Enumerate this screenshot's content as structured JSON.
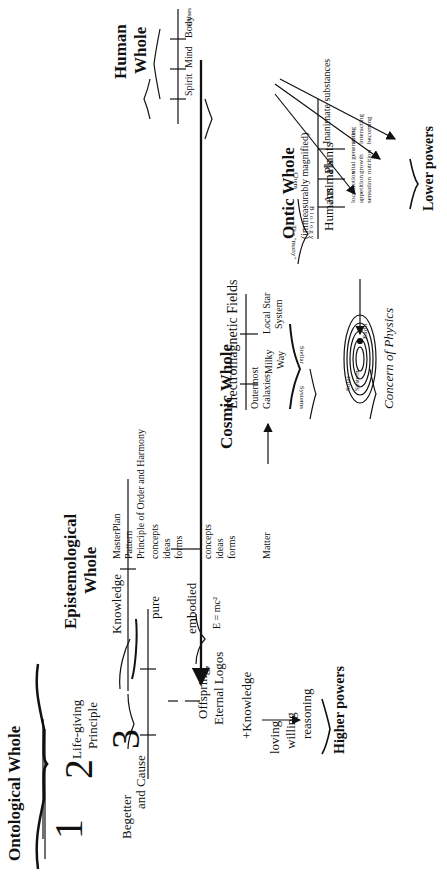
{
  "ontological": {
    "title": "Ontological Whole",
    "num1": "1",
    "num2": "2",
    "num3": "3",
    "begetter": "Begetter",
    "and_cause": "and Cause",
    "life_giving": "Life-giving",
    "principle": "Principle",
    "offspring": "Offspring,",
    "eternal_logos": "Eternal Logos",
    "plus_knowledge": "+Knowledge",
    "higher_powers": [
      "loving",
      "willing",
      "reasoning"
    ],
    "higher_powers_label": "Higher powers"
  },
  "epistemological": {
    "title_line1": "Epistemological",
    "title_line2": "Whole",
    "knowledge": "Knowledge",
    "masterplan": [
      "MasterPlan",
      "Pattern",
      "Principle of Order and Harmony"
    ],
    "pure": "pure",
    "pure_items": [
      "concepts",
      "ideas",
      "forms"
    ],
    "embodied": "embodied",
    "embodied_items": [
      "concepts",
      "ideas",
      "forms"
    ],
    "emc2": "E = mc²",
    "matter": "Matter"
  },
  "cosmic": {
    "title": "Cosmic Whole",
    "em_fields": "Electromagnetic Fields",
    "outermost": [
      "Outermost",
      "Galaxies"
    ],
    "milky_way": [
      "Milky",
      "Way"
    ],
    "local_star": [
      "Local Star",
      "System"
    ],
    "stellar_systems_left": "Systems",
    "stellar_systems_right": "Stellar",
    "solar_system": [
      "Solar",
      "System"
    ],
    "earth": "Earth",
    "concern_of_physics": "Concern of Physics"
  },
  "ontic": {
    "title": "Ontic Whole",
    "subtitle": "(immeasurably magnified)",
    "rows": [
      {
        "label": "Humans",
        "powers": []
      },
      {
        "label": "Animals",
        "powers": [
          "locomotion",
          "appetition",
          "sensation"
        ]
      },
      {
        "label": "Plants",
        "powers": [
          "vital generation",
          "growth",
          "nutrition"
        ]
      },
      {
        "label": "Inanimate substances",
        "powers": [
          "acting",
          "interacting",
          "becoming"
        ]
      }
    ],
    "the_many": "The \"many\"",
    "biology": "B i o l o g y",
    "chem": "Chem",
    "lower_powers_label": "Lower powers"
  },
  "human": {
    "title_line1": "Human",
    "title_line2": "Whole",
    "parts": [
      "Spirit",
      "Mind",
      "Body",
      "Senses"
    ]
  }
}
